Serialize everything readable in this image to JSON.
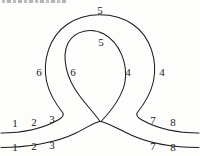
{
  "figure": {
    "background_color": "#fdfdfc",
    "stroke_color": "#1b1b1b",
    "label_color": "#1b1b1b",
    "width": 200,
    "height": 156
  },
  "labels": [
    {
      "id": "outer-top",
      "text": "5",
      "x": 100,
      "y": 11,
      "note": "above outer loop apex"
    },
    {
      "id": "inner-top",
      "text": "5",
      "x": 101,
      "y": 43,
      "note": "inside inner loop near apex"
    },
    {
      "id": "outer-left",
      "text": "6",
      "x": 39,
      "y": 73,
      "note": "left of outer loop strand"
    },
    {
      "id": "inner-left",
      "text": "6",
      "x": 73,
      "y": 73,
      "note": "inside inner loop, left"
    },
    {
      "id": "inner-right",
      "text": "4",
      "x": 128,
      "y": 73,
      "note": "inside inner loop, right"
    },
    {
      "id": "outer-right",
      "text": "4",
      "x": 162,
      "y": 73,
      "note": "right of outer loop strand"
    },
    {
      "id": "upper-tail-l-1",
      "text": "1",
      "x": 15,
      "y": 124,
      "note": "upper left tail, outermost"
    },
    {
      "id": "upper-tail-l-2",
      "text": "2",
      "x": 34,
      "y": 123,
      "note": "upper left tail, middle"
    },
    {
      "id": "upper-tail-l-3",
      "text": "3",
      "x": 52,
      "y": 120,
      "note": "upper left tail, innermost"
    },
    {
      "id": "lower-tail-l-1",
      "text": "1",
      "x": 15,
      "y": 148,
      "note": "lower left tail, outermost"
    },
    {
      "id": "lower-tail-l-2",
      "text": "2",
      "x": 34,
      "y": 147,
      "note": "lower left tail, middle"
    },
    {
      "id": "lower-tail-l-3",
      "text": "3",
      "x": 52,
      "y": 146,
      "note": "lower left tail, innermost"
    },
    {
      "id": "upper-tail-r-7",
      "text": "7",
      "x": 153,
      "y": 121,
      "note": "upper right tail, innermost"
    },
    {
      "id": "upper-tail-r-8",
      "text": "8",
      "x": 173,
      "y": 123,
      "note": "upper right tail, outermost"
    },
    {
      "id": "lower-tail-r-7",
      "text": "7",
      "x": 153,
      "y": 147,
      "note": "lower right tail, innermost"
    },
    {
      "id": "lower-tail-r-8",
      "text": "8",
      "x": 173,
      "y": 148,
      "note": "lower right tail, outermost"
    }
  ],
  "strands": {
    "outer_loop_path": "M 2 133 C 24 133 46 128 62 118 C 64 117 65 115 64 113 C 57 104 50 95 47 82 C 43 62 50 38 68 25 C 86 12 114 12 132 25 C 150 38 157 62 153 82 C 150 95 143 104 136 113 C 135 115 136 117 138 118 C 154 128 176 133 198 133",
    "inner_loop_path": "M 2 147 C 30 147 62 141 84 128 C 93 122 103 113 110 101 C 122 81 126 56 117 41 C 110 29 92 27 82 38 C 72 49 70 72 78 91 C 85 108 98 120 112 128 C 134 141 168 147 198 147",
    "description": "Two continuous strands; each enters from the lower left, loops around the top, and exits to the lower right, crossing near x=100 y=122"
  }
}
